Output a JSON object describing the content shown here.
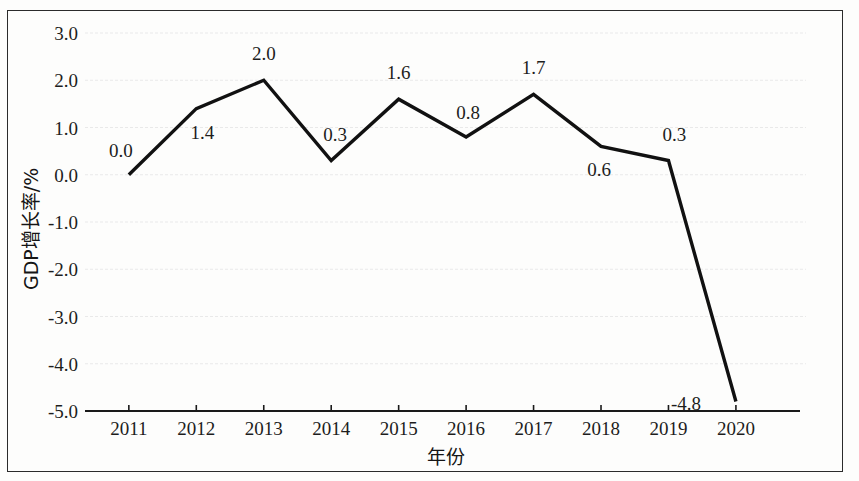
{
  "figure": {
    "background_color": "#fdfdfc",
    "frame_color": "#2b2b2b",
    "line_color": "#111111",
    "grid_color": "#e9e9e9"
  },
  "chart_data": {
    "type": "line",
    "title": "",
    "xlabel": "年份",
    "ylabel": "GDP增长率/%",
    "categories": [
      "2011",
      "2012",
      "2013",
      "2014",
      "2015",
      "2016",
      "2017",
      "2018",
      "2019",
      "2020"
    ],
    "values": [
      0.0,
      1.4,
      2.0,
      0.3,
      1.6,
      0.8,
      1.7,
      0.6,
      0.3,
      -4.8
    ],
    "point_labels": [
      "0.0",
      "1.4",
      "2.0",
      "0.3",
      "1.6",
      "0.8",
      "1.7",
      "0.6",
      "0.3",
      "-4.8"
    ],
    "ytick_labels": [
      "3.0",
      "2.0",
      "1.0",
      "0.0",
      "-1.0",
      "-2.0",
      "-3.0",
      "-4.0",
      "-5.0"
    ],
    "ytick_values": [
      3.0,
      2.0,
      1.0,
      0.0,
      -1.0,
      -2.0,
      -3.0,
      -4.0,
      -5.0
    ],
    "ylim": [
      -5.0,
      3.0
    ],
    "grid": true,
    "grid_axis": "y",
    "legend": "none",
    "series": [
      {
        "name": "GDP增长率",
        "values": [
          0.0,
          1.4,
          2.0,
          0.3,
          1.6,
          0.8,
          1.7,
          0.6,
          0.3,
          -4.8
        ]
      }
    ]
  },
  "label_offsets": [
    {
      "dx": -8,
      "dy": -18,
      "anchor": "middle"
    },
    {
      "dx": 6,
      "dy": 30,
      "anchor": "middle"
    },
    {
      "dx": 0,
      "dy": -20,
      "anchor": "middle"
    },
    {
      "dx": 4,
      "dy": -20,
      "anchor": "middle"
    },
    {
      "dx": 0,
      "dy": -20,
      "anchor": "middle"
    },
    {
      "dx": 2,
      "dy": -18,
      "anchor": "middle"
    },
    {
      "dx": 0,
      "dy": -20,
      "anchor": "middle"
    },
    {
      "dx": -2,
      "dy": 30,
      "anchor": "middle"
    },
    {
      "dx": 6,
      "dy": -20,
      "anchor": "middle"
    },
    {
      "dx": -50,
      "dy": 8,
      "anchor": "middle"
    }
  ]
}
